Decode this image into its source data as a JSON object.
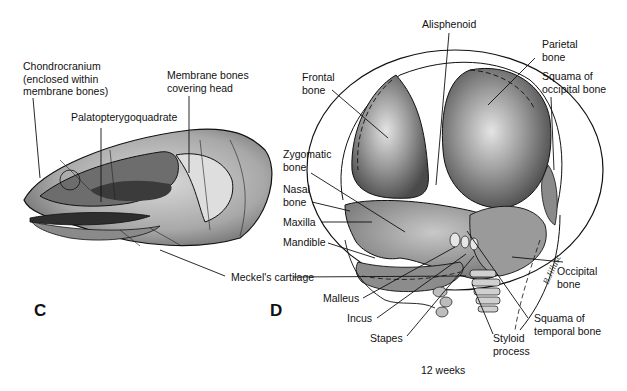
{
  "figure": {
    "caption": "12 weeks",
    "panels": [
      {
        "id": "C",
        "letter": "C",
        "subject": "Lateral view of primitive skull (chondrocranium with membrane bones)",
        "labels": [
          {
            "key": "chondrocranium",
            "text": "Chondrocranium\n(enclosed within\nmembrane bones)"
          },
          {
            "key": "membrane_bones",
            "text": "Membrane bones\ncovering head"
          },
          {
            "key": "palatopterygoquadrate",
            "text": "Palatopterygoquadrate"
          },
          {
            "key": "meckels",
            "text": "Meckel's cartilage"
          }
        ]
      },
      {
        "id": "D",
        "letter": "D",
        "subject": "Fetal human skull at 12 weeks, lateral view",
        "labels": [
          {
            "key": "alisphenoid",
            "text": "Alisphenoid"
          },
          {
            "key": "parietal",
            "text": "Parietal\nbone"
          },
          {
            "key": "frontal",
            "text": "Frontal\nbone"
          },
          {
            "key": "squama_occipital",
            "text": "Squama of\noccipital bone"
          },
          {
            "key": "zygomatic",
            "text": "Zygomatic\nbone"
          },
          {
            "key": "nasal",
            "text": "Nasal\nbone"
          },
          {
            "key": "maxilla",
            "text": "Maxilla"
          },
          {
            "key": "mandible",
            "text": "Mandible"
          },
          {
            "key": "occipital",
            "text": "Occipital\nbone"
          },
          {
            "key": "malleus",
            "text": "Malleus"
          },
          {
            "key": "incus",
            "text": "Incus"
          },
          {
            "key": "stapes",
            "text": "Stapes"
          },
          {
            "key": "styloid",
            "text": "Styloid\nprocess"
          },
          {
            "key": "squama_temporal",
            "text": "Squama of\ntemporal bone"
          }
        ]
      }
    ]
  }
}
